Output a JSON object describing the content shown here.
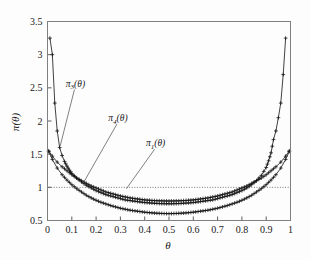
{
  "figure": {
    "background_color": "#fdfdfd",
    "frame_color": "#808080",
    "curve_color": "#111111",
    "reference_line_color": "#555555"
  },
  "axes": {
    "x_title": "θ",
    "y_title": "π(θ)",
    "x_ticks": [
      "0",
      "0.1",
      "0.2",
      "0.3",
      "0.4",
      "0.5",
      "0.6",
      "0.7",
      "0.8",
      "0.9",
      "1"
    ],
    "y_ticks": [
      "0.5",
      "1",
      "1.5",
      "2",
      "2.5",
      "3",
      "3.5"
    ]
  },
  "annotations": {
    "pi3": {
      "text": "π",
      "sub": "3",
      "arg": "(θ)"
    },
    "pi4": {
      "text": "π",
      "sub": "4",
      "arg": "(θ)"
    },
    "pi1": {
      "text": "π",
      "sub": "1",
      "arg": "(θ)"
    }
  },
  "chart_data": {
    "type": "line",
    "title": "",
    "xlabel": "θ",
    "ylabel": "π(θ)",
    "xlim": [
      0,
      1
    ],
    "ylim": [
      0.5,
      3.5
    ],
    "grid": false,
    "legend_position": "inline-annotations",
    "marker": "plus",
    "reference_lines": [
      {
        "orientation": "horizontal",
        "value": 1,
        "style": "dotted",
        "label": ""
      }
    ],
    "series": [
      {
        "name": "π3(θ)",
        "label": "pi_3",
        "x": [
          0.01,
          0.02,
          0.03,
          0.04,
          0.05,
          0.06,
          0.07,
          0.08,
          0.09,
          0.1,
          0.12,
          0.14,
          0.16,
          0.18,
          0.2,
          0.22,
          0.24,
          0.26,
          0.28,
          0.3,
          0.32,
          0.34,
          0.36,
          0.38,
          0.4,
          0.42,
          0.44,
          0.46,
          0.48,
          0.5,
          0.52,
          0.54,
          0.56,
          0.58,
          0.6,
          0.62,
          0.64,
          0.66,
          0.68,
          0.7,
          0.72,
          0.74,
          0.76,
          0.78,
          0.8,
          0.82,
          0.84,
          0.86,
          0.88,
          0.9,
          0.91,
          0.92,
          0.93,
          0.94,
          0.95,
          0.96,
          0.97,
          0.98
        ],
        "y": [
          3.25,
          3.0,
          2.27,
          1.85,
          1.6,
          1.48,
          1.39,
          1.32,
          1.26,
          1.21,
          1.14,
          1.08,
          1.03,
          0.99,
          0.95,
          0.92,
          0.89,
          0.87,
          0.85,
          0.83,
          0.81,
          0.8,
          0.79,
          0.78,
          0.77,
          0.765,
          0.76,
          0.755,
          0.753,
          0.752,
          0.753,
          0.755,
          0.76,
          0.765,
          0.77,
          0.78,
          0.79,
          0.8,
          0.81,
          0.83,
          0.85,
          0.87,
          0.89,
          0.92,
          0.95,
          0.99,
          1.04,
          1.1,
          1.18,
          1.3,
          1.4,
          1.52,
          1.72,
          1.85,
          2.05,
          2.27,
          2.7,
          3.25
        ]
      },
      {
        "name": "π4(θ)",
        "label": "pi_4",
        "x": [
          0.005,
          0.02,
          0.04,
          0.06,
          0.08,
          0.1,
          0.12,
          0.14,
          0.16,
          0.18,
          0.2,
          0.22,
          0.24,
          0.26,
          0.28,
          0.3,
          0.32,
          0.34,
          0.36,
          0.38,
          0.4,
          0.42,
          0.44,
          0.46,
          0.48,
          0.5,
          0.52,
          0.54,
          0.56,
          0.58,
          0.6,
          0.62,
          0.64,
          0.66,
          0.68,
          0.7,
          0.72,
          0.74,
          0.76,
          0.78,
          0.8,
          0.82,
          0.84,
          0.86,
          0.88,
          0.9,
          0.92,
          0.94,
          0.96,
          0.98,
          0.995
        ],
        "y": [
          1.55,
          1.47,
          1.38,
          1.31,
          1.25,
          1.19,
          1.14,
          1.1,
          1.06,
          1.02,
          0.99,
          0.96,
          0.93,
          0.91,
          0.89,
          0.87,
          0.855,
          0.84,
          0.83,
          0.82,
          0.81,
          0.805,
          0.8,
          0.797,
          0.795,
          0.794,
          0.795,
          0.797,
          0.8,
          0.805,
          0.81,
          0.82,
          0.83,
          0.84,
          0.855,
          0.87,
          0.89,
          0.91,
          0.93,
          0.96,
          0.99,
          1.02,
          1.06,
          1.1,
          1.14,
          1.19,
          1.25,
          1.31,
          1.38,
          1.47,
          1.55
        ]
      },
      {
        "name": "π1(θ)",
        "label": "pi_1",
        "x": [
          0.005,
          0.02,
          0.04,
          0.06,
          0.08,
          0.1,
          0.12,
          0.14,
          0.16,
          0.18,
          0.2,
          0.22,
          0.24,
          0.26,
          0.28,
          0.3,
          0.32,
          0.34,
          0.36,
          0.38,
          0.4,
          0.42,
          0.44,
          0.46,
          0.48,
          0.5,
          0.52,
          0.54,
          0.56,
          0.58,
          0.6,
          0.62,
          0.64,
          0.66,
          0.68,
          0.7,
          0.72,
          0.74,
          0.76,
          0.78,
          0.8,
          0.82,
          0.84,
          0.86,
          0.88,
          0.9,
          0.92,
          0.94,
          0.96,
          0.98,
          0.995
        ],
        "y": [
          1.54,
          1.42,
          1.29,
          1.19,
          1.11,
          1.04,
          0.98,
          0.93,
          0.88,
          0.84,
          0.805,
          0.775,
          0.75,
          0.725,
          0.705,
          0.685,
          0.67,
          0.655,
          0.645,
          0.635,
          0.625,
          0.618,
          0.612,
          0.608,
          0.605,
          0.603,
          0.605,
          0.608,
          0.612,
          0.618,
          0.625,
          0.635,
          0.645,
          0.655,
          0.67,
          0.685,
          0.705,
          0.725,
          0.75,
          0.775,
          0.805,
          0.84,
          0.88,
          0.93,
          0.98,
          1.04,
          1.11,
          1.19,
          1.29,
          1.42,
          1.54
        ]
      }
    ],
    "annotations": [
      {
        "text": "π3(θ)",
        "x": 0.115,
        "y": 2.52,
        "leader_to_x": 0.052,
        "leader_to_y": 1.62
      },
      {
        "text": "π4(θ)",
        "x": 0.29,
        "y": 2.0,
        "leader_to_x": 0.145,
        "leader_to_y": 1.05
      },
      {
        "text": "π1(θ)",
        "x": 0.445,
        "y": 1.62,
        "leader_to_x": 0.325,
        "leader_to_y": 0.98
      }
    ]
  }
}
